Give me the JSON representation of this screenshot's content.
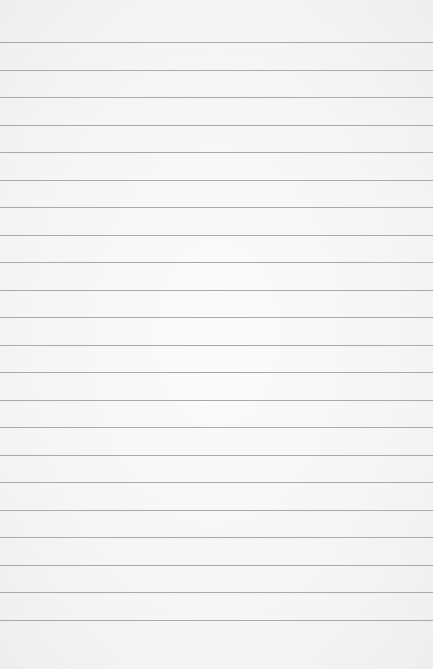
{
  "paper": {
    "background_color": "#f6f6f5",
    "rule_color": "#a9a9a9",
    "rules": {
      "count": 22,
      "first_y": 42,
      "spacing": 27.52
    }
  }
}
